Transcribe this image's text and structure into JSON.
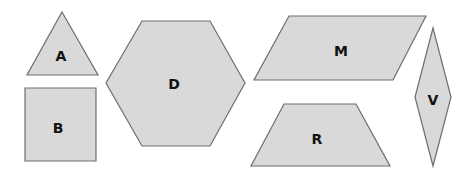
{
  "colors": {
    "fill": "#d9d9d9",
    "stroke": "#6e6e6e",
    "label": "#111111",
    "background": "#ffffff"
  },
  "shapes": [
    {
      "label": "A",
      "type": "triangle",
      "points": "62,12 98,75 27,75",
      "lx": 61,
      "ly": 57
    },
    {
      "label": "B",
      "type": "square",
      "points": "25,88 96,88 96,161 25,161",
      "lx": 58,
      "ly": 129
    },
    {
      "label": "D",
      "type": "hexagon",
      "points": "142,21 210,21 245,83 210,146 142,146 106,83",
      "lx": 174,
      "ly": 85
    },
    {
      "label": "M",
      "type": "parallelogram",
      "points": "289,16 426,16 393,80 254,80",
      "lx": 341,
      "ly": 52
    },
    {
      "label": "R",
      "type": "trapezoid",
      "points": "284,104 356,104 390,166 251,166",
      "lx": 317,
      "ly": 140
    },
    {
      "label": "V",
      "type": "rhombus",
      "points": "433,28 451,97 433,166 415,97",
      "lx": 433,
      "ly": 101
    }
  ]
}
